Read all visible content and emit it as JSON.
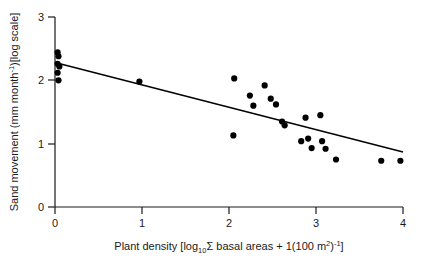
{
  "chart_data": {
    "type": "scatter",
    "title": "",
    "xlabel": "Plant density [log10 Σ basal areas + 1(100 m2)-1]",
    "ylabel": "Sand movement (mm month-1)[log scale]",
    "xlim": [
      0,
      4
    ],
    "ylim": [
      0,
      3
    ],
    "xticks": [
      0,
      1,
      2,
      3,
      4
    ],
    "yticks": [
      0,
      1,
      2,
      3
    ],
    "xtick_labels": [
      "0",
      "1",
      "2",
      "3",
      "4"
    ],
    "ytick_labels": [
      "0",
      "1",
      "2",
      "3"
    ],
    "grid": false,
    "legend": null,
    "marker": "filled-circle",
    "marker_color": "#000000",
    "points": [
      {
        "x": 0.03,
        "y": 2.44
      },
      {
        "x": 0.04,
        "y": 2.38
      },
      {
        "x": 0.03,
        "y": 2.26
      },
      {
        "x": 0.05,
        "y": 2.22
      },
      {
        "x": 0.03,
        "y": 2.12
      },
      {
        "x": 0.04,
        "y": 2.0
      },
      {
        "x": 0.97,
        "y": 1.98
      },
      {
        "x": 2.06,
        "y": 2.03
      },
      {
        "x": 2.05,
        "y": 1.13
      },
      {
        "x": 2.24,
        "y": 1.76
      },
      {
        "x": 2.28,
        "y": 1.6
      },
      {
        "x": 2.41,
        "y": 1.92
      },
      {
        "x": 2.48,
        "y": 1.71
      },
      {
        "x": 2.54,
        "y": 1.62
      },
      {
        "x": 2.61,
        "y": 1.35
      },
      {
        "x": 2.64,
        "y": 1.29
      },
      {
        "x": 2.83,
        "y": 1.04
      },
      {
        "x": 2.88,
        "y": 1.41
      },
      {
        "x": 2.91,
        "y": 1.08
      },
      {
        "x": 2.95,
        "y": 0.93
      },
      {
        "x": 3.05,
        "y": 1.45
      },
      {
        "x": 3.07,
        "y": 1.04
      },
      {
        "x": 3.11,
        "y": 0.92
      },
      {
        "x": 3.23,
        "y": 0.75
      },
      {
        "x": 3.75,
        "y": 0.73
      },
      {
        "x": 3.97,
        "y": 0.73
      }
    ],
    "trendline": {
      "type": "linear-regression",
      "x_start": 0.0,
      "y_start": 2.28,
      "x_end": 4.0,
      "y_end": 0.87,
      "color": "#000000"
    }
  },
  "axes": {
    "x_title_parts": {
      "lead": "Plant density [log",
      "sub10": "10",
      "sigma": "Σ",
      "mid": " basal areas + 1(100 m",
      "sup2": "2",
      "close_paren": ")",
      "sup_neg1": "-1",
      "tail": "]"
    },
    "y_title_parts": {
      "lead": "Sand movement (mm month",
      "sup_neg1": "-1",
      "tail": ")[log scale]"
    }
  }
}
